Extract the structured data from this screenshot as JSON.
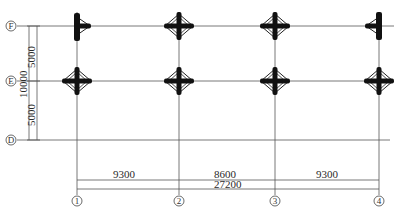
{
  "drawing": {
    "type": "structural column grid plan",
    "colors": {
      "line": "#555555",
      "column": "#111111",
      "text": "#2a2a2a",
      "background": "#ffffff"
    }
  },
  "axes": {
    "horizontal": [
      {
        "label": "F",
        "y": 26
      },
      {
        "label": "E",
        "y": 81
      },
      {
        "label": "D",
        "y": 140
      }
    ],
    "vertical": [
      {
        "label": "1",
        "x": 77
      },
      {
        "label": "2",
        "x": 179
      },
      {
        "label": "3",
        "x": 275
      },
      {
        "label": "4",
        "x": 379
      }
    ]
  },
  "dimensions": {
    "vertical": {
      "segments": [
        "5000",
        "5000"
      ],
      "total": "10000"
    },
    "horizontal": {
      "segments": [
        "9300",
        "8600",
        "9300"
      ],
      "total": "27200"
    }
  },
  "columns": [
    {
      "axis": "F-1",
      "shape": "T-left"
    },
    {
      "axis": "F-2",
      "shape": "cross"
    },
    {
      "axis": "F-3",
      "shape": "cross"
    },
    {
      "axis": "F-4",
      "shape": "T-right"
    },
    {
      "axis": "E-1",
      "shape": "cross"
    },
    {
      "axis": "E-2",
      "shape": "cross"
    },
    {
      "axis": "E-3",
      "shape": "cross"
    },
    {
      "axis": "E-4",
      "shape": "cross"
    }
  ]
}
